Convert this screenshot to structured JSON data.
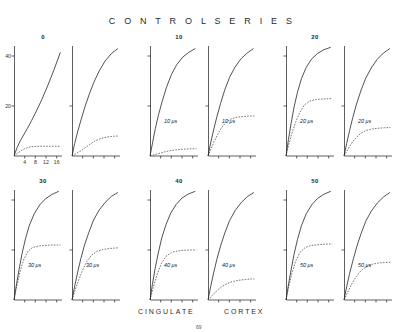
{
  "figure": {
    "title": "C O N T R O L    S E R I E S",
    "bottom_labels": [
      "CINGULATE",
      "CORTEX"
    ],
    "page_number": "69",
    "axis": {
      "y_ticks": [
        "40",
        "20"
      ],
      "y_max": 40,
      "x_ticks": [
        "4",
        "8",
        "12",
        "16"
      ],
      "x_max": 18
    },
    "colors": {
      "ink": "#1a1a1a",
      "solid": "#262626",
      "dashed": "#3a3a3a"
    }
  },
  "chart_data": {
    "type": "line",
    "xlabel": "",
    "ylabel": "",
    "xlim": [
      0,
      18
    ],
    "ylim": [
      0,
      44
    ],
    "grid": false,
    "legend": "none",
    "groups": [
      {
        "label": "0",
        "row": 0,
        "panels": [
          {
            "column": "CINGULATE",
            "annotation": "",
            "series": [
              {
                "name": "solid",
                "style": "solid",
                "x": [
                  0,
                  1.2,
                  2.4,
                  3.6,
                  5.0,
                  6.6,
                  8.4,
                  10.4,
                  12.6,
                  15.0,
                  17.4
                ],
                "y": [
                  0,
                  3.5,
                  6.2,
                  8.4,
                  11.0,
                  14.2,
                  18.0,
                  22.5,
                  28.0,
                  34.5,
                  41.5
                ]
              },
              {
                "name": "dashed",
                "style": "dashed",
                "x": [
                  0,
                  1.4,
                  2.8,
                  4.2,
                  5.6,
                  7.2,
                  9.0,
                  11.5,
                  14.0,
                  17.4
                ],
                "y": [
                  0,
                  1.2,
                  2.2,
                  3.0,
                  3.5,
                  3.8,
                  3.9,
                  3.9,
                  3.9,
                  3.9
                ]
              }
            ]
          },
          {
            "column": "CORTEX",
            "annotation": "",
            "series": [
              {
                "name": "solid",
                "style": "solid",
                "x": [
                  0,
                  1.0,
                  2.2,
                  3.4,
                  4.8,
                  6.4,
                  8.2,
                  10.2,
                  12.4,
                  14.8,
                  17.2
                ],
                "y": [
                  0,
                  5.0,
                  10.0,
                  14.5,
                  19.5,
                  24.5,
                  29.5,
                  34.0,
                  38.0,
                  41.0,
                  43.0
                ]
              },
              {
                "name": "dashed",
                "style": "dashed",
                "x": [
                  0,
                  1.6,
                  3.2,
                  4.8,
                  6.6,
                  8.6,
                  10.8,
                  13.2,
                  15.6,
                  17.4
                ],
                "y": [
                  0,
                  1.0,
                  2.0,
                  3.2,
                  4.6,
                  6.0,
                  7.0,
                  7.6,
                  7.9,
                  8.0
                ]
              }
            ]
          }
        ]
      },
      {
        "label": "10",
        "row": 0,
        "panels": [
          {
            "column": "CINGULATE",
            "annotation": "10 μs",
            "series": [
              {
                "name": "solid",
                "style": "solid",
                "x": [
                  0,
                  1.0,
                  2.0,
                  3.2,
                  4.6,
                  6.2,
                  8.0,
                  10.0,
                  12.2,
                  14.6,
                  17.0
                ],
                "y": [
                  0,
                  5.5,
                  11.0,
                  16.5,
                  22.0,
                  27.5,
                  32.5,
                  36.5,
                  39.5,
                  41.5,
                  43.0
                ]
              },
              {
                "name": "dashed",
                "style": "dashed",
                "x": [
                  0,
                  2.0,
                  4.0,
                  6.0,
                  8.0,
                  10.0,
                  12.0,
                  14.0,
                  16.0,
                  17.4
                ],
                "y": [
                  0,
                  0.6,
                  1.2,
                  1.8,
                  2.2,
                  2.5,
                  2.7,
                  2.8,
                  2.9,
                  2.9
                ]
              }
            ]
          },
          {
            "column": "CORTEX",
            "annotation": "10 μs",
            "series": [
              {
                "name": "solid",
                "style": "solid",
                "x": [
                  0,
                  1.0,
                  2.1,
                  3.3,
                  4.7,
                  6.3,
                  8.1,
                  10.1,
                  12.3,
                  14.7,
                  17.1
                ],
                "y": [
                  0,
                  5.2,
                  10.4,
                  15.6,
                  21.0,
                  26.5,
                  31.5,
                  35.5,
                  38.8,
                  41.2,
                  43.0
                ]
              },
              {
                "name": "dashed",
                "style": "dashed",
                "x": [
                  0,
                  1.2,
                  2.4,
                  3.8,
                  5.2,
                  6.8,
                  8.6,
                  10.8,
                  13.2,
                  15.6,
                  17.4
                ],
                "y": [
                  0,
                  3.0,
                  6.0,
                  9.0,
                  11.5,
                  13.5,
                  14.8,
                  15.5,
                  15.8,
                  16.0,
                  16.0
                ]
              }
            ]
          }
        ]
      },
      {
        "label": "20",
        "row": 0,
        "panels": [
          {
            "column": "CINGULATE",
            "annotation": "20 μs",
            "series": [
              {
                "name": "solid",
                "style": "solid",
                "x": [
                  0,
                  0.9,
                  1.9,
                  3.0,
                  4.3,
                  5.8,
                  7.6,
                  9.6,
                  11.8,
                  14.2,
                  16.8
                ],
                "y": [
                  0,
                  6.5,
                  13.0,
                  19.5,
                  25.5,
                  31.0,
                  35.5,
                  38.8,
                  41.0,
                  42.5,
                  43.5
                ]
              },
              {
                "name": "dashed",
                "style": "dashed",
                "x": [
                  0,
                  1.0,
                  2.2,
                  3.6,
                  5.2,
                  7.0,
                  9.0,
                  11.2,
                  13.6,
                  16.0,
                  17.4
                ],
                "y": [
                  0,
                  4.5,
                  9.0,
                  13.5,
                  17.5,
                  20.5,
                  22.0,
                  22.6,
                  22.8,
                  22.9,
                  23.0
                ]
              }
            ]
          },
          {
            "column": "CORTEX",
            "annotation": "20 μs",
            "series": [
              {
                "name": "solid",
                "style": "solid",
                "x": [
                  0,
                  1.0,
                  2.1,
                  3.3,
                  4.7,
                  6.3,
                  8.1,
                  10.2,
                  12.4,
                  14.8,
                  17.2
                ],
                "y": [
                  0,
                  5.0,
                  10.2,
                  15.4,
                  20.8,
                  26.0,
                  31.0,
                  35.2,
                  38.6,
                  41.2,
                  43.0
                ]
              },
              {
                "name": "dashed",
                "style": "dashed",
                "x": [
                  0,
                  1.4,
                  2.8,
                  4.4,
                  6.2,
                  8.2,
                  10.4,
                  12.8,
                  15.2,
                  17.4
                ],
                "y": [
                  0,
                  2.5,
                  5.0,
                  7.2,
                  9.0,
                  10.2,
                  10.8,
                  11.1,
                  11.3,
                  11.4
                ]
              }
            ]
          }
        ]
      },
      {
        "label": "30",
        "row": 1,
        "panels": [
          {
            "column": "CINGULATE",
            "annotation": "30 μs",
            "series": [
              {
                "name": "solid",
                "style": "solid",
                "x": [
                  0,
                  0.9,
                  1.9,
                  3.0,
                  4.3,
                  5.8,
                  7.6,
                  9.6,
                  11.8,
                  14.2,
                  16.8
                ],
                "y": [
                  0,
                  6.0,
                  12.2,
                  18.5,
                  24.5,
                  30.0,
                  34.5,
                  38.0,
                  40.5,
                  42.2,
                  43.5
                ]
              },
              {
                "name": "dashed",
                "style": "dashed",
                "x": [
                  0,
                  1.0,
                  2.2,
                  3.6,
                  5.2,
                  7.0,
                  9.2,
                  11.6,
                  14.0,
                  16.4,
                  17.4
                ],
                "y": [
                  0,
                  5.5,
                  11.0,
                  16.0,
                  19.5,
                  21.0,
                  21.6,
                  21.8,
                  22.0,
                  22.0,
                  22.0
                ]
              }
            ]
          },
          {
            "column": "CORTEX",
            "annotation": "30 μs",
            "series": [
              {
                "name": "solid",
                "style": "solid",
                "x": [
                  0,
                  1.0,
                  2.1,
                  3.3,
                  4.7,
                  6.3,
                  8.1,
                  10.2,
                  12.4,
                  14.8,
                  17.2
                ],
                "y": [
                  0,
                  5.5,
                  11.0,
                  16.5,
                  22.0,
                  27.0,
                  32.0,
                  36.0,
                  39.0,
                  41.5,
                  43.0
                ]
              },
              {
                "name": "dashed",
                "style": "dashed",
                "x": [
                  0,
                  1.2,
                  2.5,
                  4.0,
                  5.6,
                  7.4,
                  9.4,
                  11.6,
                  14.0,
                  16.4,
                  17.4
                ],
                "y": [
                  0,
                  4.0,
                  8.0,
                  12.0,
                  15.5,
                  18.0,
                  19.5,
                  20.2,
                  20.6,
                  20.8,
                  20.9
                ]
              }
            ]
          }
        ]
      },
      {
        "label": "40",
        "row": 1,
        "panels": [
          {
            "column": "CINGULATE",
            "annotation": "40 μs",
            "series": [
              {
                "name": "solid",
                "style": "solid",
                "x": [
                  0,
                  0.9,
                  1.9,
                  3.1,
                  4.4,
                  6.0,
                  7.8,
                  9.8,
                  12.0,
                  14.4,
                  17.0
                ],
                "y": [
                  0,
                  6.2,
                  12.5,
                  18.8,
                  24.8,
                  30.2,
                  34.8,
                  38.2,
                  40.8,
                  42.4,
                  43.5
                ]
              },
              {
                "name": "dashed",
                "style": "dashed",
                "x": [
                  0,
                  1.2,
                  2.6,
                  4.2,
                  6.0,
                  8.0,
                  10.2,
                  12.6,
                  15.0,
                  17.4
                ],
                "y": [
                  0,
                  5.0,
                  10.0,
                  14.5,
                  17.5,
                  19.0,
                  19.6,
                  19.9,
                  20.0,
                  20.0
                ]
              }
            ]
          },
          {
            "column": "CORTEX",
            "annotation": "40 μs",
            "series": [
              {
                "name": "solid",
                "style": "solid",
                "x": [
                  0,
                  1.0,
                  2.1,
                  3.3,
                  4.7,
                  6.3,
                  8.1,
                  10.2,
                  12.4,
                  14.8,
                  17.2
                ],
                "y": [
                  0,
                  5.4,
                  10.8,
                  16.2,
                  21.6,
                  26.8,
                  31.8,
                  35.8,
                  38.9,
                  41.4,
                  43.0
                ]
              },
              {
                "name": "dashed",
                "style": "dashed",
                "x": [
                  0,
                  1.6,
                  3.2,
                  5.0,
                  7.0,
                  9.2,
                  11.6,
                  14.0,
                  16.4,
                  17.4
                ],
                "y": [
                  0,
                  1.8,
                  3.6,
                  5.2,
                  6.5,
                  7.4,
                  7.9,
                  8.2,
                  8.4,
                  8.4
                ]
              }
            ]
          }
        ]
      },
      {
        "label": "50",
        "row": 1,
        "panels": [
          {
            "column": "CINGULATE",
            "annotation": "50 μs",
            "series": [
              {
                "name": "solid",
                "style": "solid",
                "x": [
                  0,
                  0.9,
                  1.9,
                  3.0,
                  4.3,
                  5.8,
                  7.6,
                  9.6,
                  11.8,
                  14.2,
                  16.8
                ],
                "y": [
                  0,
                  6.0,
                  12.0,
                  18.2,
                  24.2,
                  29.8,
                  34.5,
                  38.0,
                  40.6,
                  42.3,
                  43.5
                ]
              },
              {
                "name": "dashed",
                "style": "dashed",
                "x": [
                  0,
                  1.0,
                  2.2,
                  3.6,
                  5.2,
                  7.2,
                  9.4,
                  11.8,
                  14.2,
                  16.6,
                  17.4
                ],
                "y": [
                  0,
                  5.2,
                  10.5,
                  15.5,
                  19.0,
                  21.0,
                  21.8,
                  22.1,
                  22.3,
                  22.4,
                  22.4
                ]
              }
            ]
          },
          {
            "column": "CORTEX",
            "annotation": "50 μs",
            "series": [
              {
                "name": "solid",
                "style": "solid",
                "x": [
                  0,
                  1.0,
                  2.1,
                  3.4,
                  4.8,
                  6.4,
                  8.2,
                  10.3,
                  12.5,
                  14.9,
                  17.2
                ],
                "y": [
                  0,
                  5.3,
                  10.6,
                  16.0,
                  21.4,
                  26.6,
                  31.6,
                  35.7,
                  38.8,
                  41.3,
                  43.0
                ]
              },
              {
                "name": "dashed",
                "style": "dashed",
                "x": [
                  0,
                  1.4,
                  2.9,
                  4.6,
                  6.4,
                  8.4,
                  10.6,
                  13.0,
                  15.4,
                  17.4
                ],
                "y": [
                  0,
                  3.2,
                  6.4,
                  9.4,
                  11.8,
                  13.4,
                  14.3,
                  14.8,
                  15.0,
                  15.1
                ]
              }
            ]
          }
        ]
      }
    ]
  }
}
